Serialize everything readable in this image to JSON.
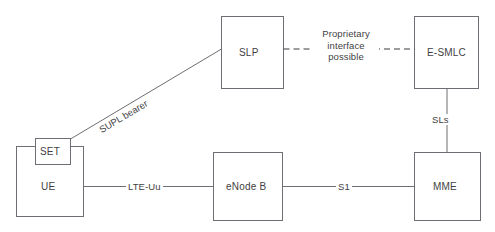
{
  "diagram": {
    "colors": {
      "box_stroke": "#6e6e74",
      "line": "#6e6e74",
      "dashed_line": "#3a3a3e",
      "text": "#3f3f44",
      "background": "#ffffff"
    },
    "nodes": [
      {
        "id": "set",
        "label": "SET"
      },
      {
        "id": "ue",
        "label": "UE"
      },
      {
        "id": "slp",
        "label": "SLP"
      },
      {
        "id": "esmlc",
        "label": "E-SMLC"
      },
      {
        "id": "enodeb",
        "label": "eNode B"
      },
      {
        "id": "mme",
        "label": "MME"
      }
    ],
    "edges": [
      {
        "id": "supl-bearer",
        "label": "SUPL bearer",
        "from": "set",
        "to": "slp",
        "style": "solid"
      },
      {
        "id": "proprietary",
        "label_lines": [
          "Proprietary",
          "interface",
          "possible"
        ],
        "from": "slp",
        "to": "esmlc",
        "style": "dashed"
      },
      {
        "id": "sls",
        "label": "SLs",
        "from": "esmlc",
        "to": "mme",
        "style": "solid"
      },
      {
        "id": "lte-uu",
        "label": "LTE-Uu",
        "from": "ue",
        "to": "enodeb",
        "style": "solid"
      },
      {
        "id": "s1",
        "label": "S1",
        "from": "enodeb",
        "to": "mme",
        "style": "solid"
      }
    ],
    "edge_labels": {
      "supl_bearer": "SUPL bearer",
      "proprietary_line1": "Proprietary",
      "proprietary_line2": "interface",
      "proprietary_line3": "possible",
      "sls": "SLs",
      "lte_uu": "LTE-Uu",
      "s1": "S1"
    }
  }
}
